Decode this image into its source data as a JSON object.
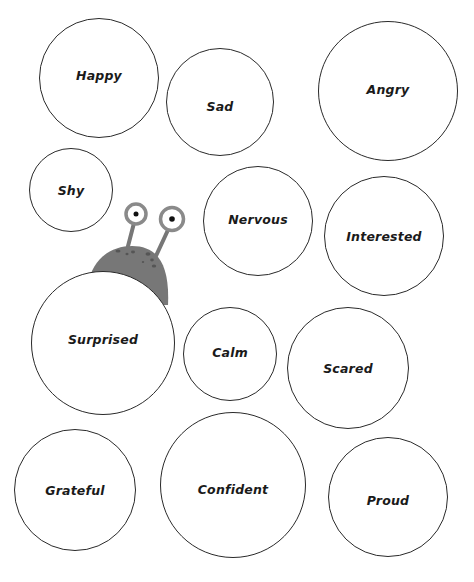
{
  "worksheet": {
    "emotions": [
      {
        "label": "Happy",
        "cx": 99,
        "cy": 78,
        "r": 60,
        "dy": -3
      },
      {
        "label": "Sad",
        "cx": 220,
        "cy": 102,
        "r": 54,
        "dy": 4
      },
      {
        "label": "Angry",
        "cx": 388,
        "cy": 91,
        "r": 70,
        "dy": -2
      },
      {
        "label": "Shy",
        "cx": 71,
        "cy": 190,
        "r": 42,
        "dy": 0
      },
      {
        "label": "Nervous",
        "cx": 258,
        "cy": 221,
        "r": 55,
        "dy": -2
      },
      {
        "label": "Interested",
        "cx": 384,
        "cy": 236,
        "r": 60,
        "dy": 0
      },
      {
        "label": "Surprised",
        "cx": 103,
        "cy": 343,
        "r": 72,
        "dy": -4
      },
      {
        "label": "Calm",
        "cx": 230,
        "cy": 354,
        "r": 47,
        "dy": -2
      },
      {
        "label": "Scared",
        "cx": 348,
        "cy": 368,
        "r": 61,
        "dy": 0
      },
      {
        "label": "Grateful",
        "cx": 75,
        "cy": 490,
        "r": 61,
        "dy": 0
      },
      {
        "label": "Confident",
        "cx": 233,
        "cy": 485,
        "r": 73,
        "dy": 4
      },
      {
        "label": "Proud",
        "cx": 388,
        "cy": 497,
        "r": 60,
        "dy": 3
      }
    ],
    "mascot": {
      "name": "peeking-monster",
      "body_color": "#777777",
      "eye_ring_color": "#8a8a8a",
      "pupil_color": "#111111"
    }
  }
}
